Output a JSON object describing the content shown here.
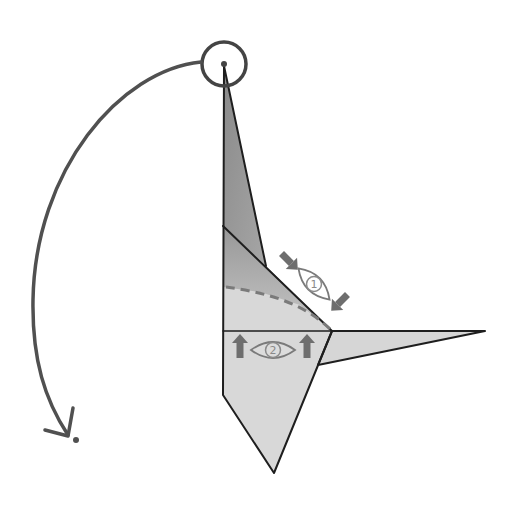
{
  "diagram": {
    "type": "origami-fold-step",
    "colors": {
      "paper_light": "#d9d9d9",
      "paper_dark": "#8c8c8c",
      "outline": "#1e1e1e",
      "arrow": "#5a5a5a",
      "symbol_gray": "#7a7a7a",
      "background": "#ffffff"
    },
    "annotations": [
      {
        "id": "view-1",
        "symbol": "eye-icon",
        "number": "1",
        "arrows": "two-inward-diagonal-arrows"
      },
      {
        "id": "view-2",
        "symbol": "eye-icon",
        "number": "2",
        "arrows": "two-up-arrows"
      }
    ],
    "rotation_arrow": {
      "kind": "curved-arrow",
      "from": "top-point-circle",
      "direction": "counter-clockwise-down"
    },
    "highlight": {
      "kind": "circle",
      "target": "top-point"
    }
  }
}
